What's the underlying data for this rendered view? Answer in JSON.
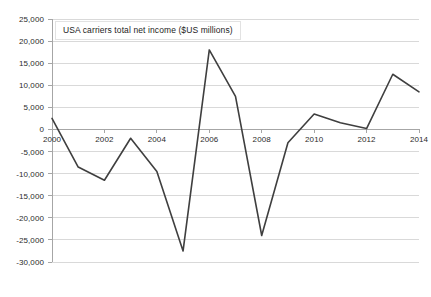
{
  "chart_data": {
    "type": "line",
    "title": "USA carriers total net income ($US millions)",
    "xlabel": "",
    "ylabel": "",
    "x": [
      2000,
      2001,
      2002,
      2003,
      2004,
      2005,
      2006,
      2007,
      2008,
      2009,
      2010,
      2011,
      2012,
      2013,
      2014
    ],
    "values": [
      2500,
      -8500,
      -11500,
      -2000,
      -9500,
      -27500,
      18000,
      7500,
      -24000,
      -3000,
      3500,
      1500,
      200,
      12500,
      8500
    ],
    "series": [
      {
        "name": "USA carriers total net income",
        "values": [
          2500,
          -8500,
          -11500,
          -2000,
          -9500,
          -27500,
          18000,
          7500,
          -24000,
          -3000,
          3500,
          1500,
          200,
          12500,
          8500
        ]
      }
    ],
    "xlim": [
      2000,
      2014
    ],
    "ylim": [
      -30000,
      25000
    ],
    "ytick_values": [
      25000,
      20000,
      15000,
      10000,
      5000,
      0,
      -5000,
      -10000,
      -15000,
      -20000,
      -25000,
      -30000
    ],
    "ytick_labels": [
      "25,000",
      "20,000",
      "15,000",
      "10,000",
      "5,000",
      "0",
      "-5,000",
      "-10,000",
      "-15,000",
      "-20,000",
      "-25,000",
      "-30,000"
    ],
    "xtick_values": [
      2000,
      2002,
      2004,
      2006,
      2008,
      2010,
      2012,
      2014
    ],
    "xtick_labels": [
      "2000",
      "2002",
      "2004",
      "2006",
      "2008",
      "2010",
      "2012",
      "2014"
    ],
    "grid": true,
    "grid_axis": "y",
    "legend": false,
    "line_color": "#3f3f3f",
    "grid_color": "#d9d9d9",
    "axis_color": "#a6a6a6",
    "background": "#ffffff"
  }
}
